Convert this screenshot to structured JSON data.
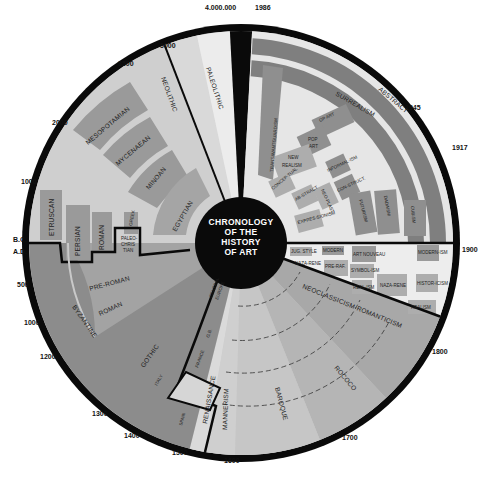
{
  "title": {
    "lines": [
      "CHRONOLOGY",
      "OF THE",
      "HISTORY",
      "OF ART"
    ]
  },
  "colors": {
    "ring": "#0a0a0a",
    "background": "#ffffff",
    "prehistoric_light": "#ececec",
    "neolithic": "#d9d9d9",
    "ancient_light": "#cfcfcf",
    "ancient_box": "#9a9a9a",
    "medieval": "#8c8c8c",
    "medieval_light": "#a9a9a9",
    "renaissance_light": "#d6d6d6",
    "baroque": "#bdbdbd",
    "modern_band": "#7f7f7f",
    "modern_bg": "#e6e6e6",
    "modern_box": "#8f8f8f",
    "modern_box_light": "#adadad"
  },
  "timeline_ticks": [
    {
      "label": "4.000.000",
      "angle": -3
    },
    {
      "label": "1986",
      "angle": 3
    },
    {
      "label": "1945",
      "angle": 46
    },
    {
      "label": "1917",
      "angle": 64
    },
    {
      "label": "1900",
      "angle": 90
    },
    {
      "label": "1800",
      "angle": 122
    },
    {
      "label": "1700",
      "angle": 152
    },
    {
      "label": "1600",
      "angle": 182
    },
    {
      "label": "1500",
      "angle": 196
    },
    {
      "label": "1400",
      "angle": 209
    },
    {
      "label": "1300",
      "angle": 222
    },
    {
      "label": "1200",
      "angle": 238
    },
    {
      "label": "1000",
      "angle": 250
    },
    {
      "label": "500",
      "angle": 261
    },
    {
      "label": "A.D.",
      "angle": 272
    },
    {
      "label": "B.C.",
      "angle": 268
    },
    {
      "label": "1000",
      "angle": 288
    },
    {
      "label": "2000",
      "angle": 305
    },
    {
      "label": "3500",
      "angle": 328
    },
    {
      "label": "5000",
      "angle": 339
    }
  ],
  "eras": {
    "prehistoric": [
      "PALEOLITHIC",
      "NEOLITHIC"
    ],
    "ancient": [
      "MESOPOTAMIAN",
      "MYCENAEAN",
      "MINOAN",
      "EGYPTIAN",
      "GREEK",
      "ETRUSCAN",
      "PERSIAN",
      "ROMAN",
      "PALEO-CHRISTIAN"
    ],
    "medieval": [
      "BYZANTINE",
      "PRE-ROMAN",
      "ROMAN",
      "GOTHIC",
      "CENTRAL EUROPE",
      "G.B.",
      "FRANCE",
      "ITALY",
      "SPAIN"
    ],
    "renaissance_baroque": [
      "RENAISSANCE",
      "MANNERISM",
      "BAROQUE",
      "ROCOCO",
      "NEOCLASSICISM-ROMANTICISM"
    ],
    "nineteenth_century": [
      "JUNG STYLE",
      "NAZARENE",
      "MODERNISM",
      "PRE-RAPHAELITE",
      "SYMBOLISM",
      "ART NOUVEAU",
      "SYMBOLISM",
      "REALISM",
      "NAZARENE",
      "MODERNISM",
      "HISTORICISM",
      "REALISM"
    ],
    "modern": [
      "ABSTRACT",
      "SURREALISM",
      "TRANSAVANTGARDISM",
      "OP ART",
      "POP ART",
      "NEW REALISM",
      "INFORMALISM",
      "CONSTRUCTIVISM",
      "FUTURISM",
      "DADAISM",
      "CUBISM",
      "CONCEPTUAL",
      "ABSTRACT",
      "NEO-PLASTICISM",
      "EXPRESSIONISM"
    ]
  },
  "labels": {
    "paleolithic": "PALEOLITHIC",
    "neolithic": "NEOLITHIC",
    "mesopotamian": "MESOPOTAMIAN",
    "mycenaean": "MYCENAEAN",
    "minoan": "MINOAN",
    "egyptian": "EGYPTIAN",
    "greek": "GREEK",
    "etruscan": "ETRUSCAN",
    "persian": "PERSIAN",
    "roman_ancient": "ROMAN",
    "paleo1": "PALEO-",
    "paleo2": "CHRIS",
    "paleo3": "TIAN",
    "byzantine": "BYZANTINE",
    "preroman": "PRE-ROMAN",
    "roman_med": "ROMAN",
    "gothic": "GOTHIC",
    "central1": "CENTRAL",
    "central2": "EUROPE",
    "gb": "G.B.",
    "france": "FRANCE",
    "italy": "ITALY",
    "spain": "SPAIN",
    "renaissance": "RENAISSANCE",
    "mannerism": "MANNERISM",
    "baroque": "BAROQUE",
    "rococo": "ROCOCO",
    "neoclassicism": "NEOCLASSICISM-ROMANTICISM",
    "abstract": "ABSTRACT",
    "surrealism": "SURREALISM",
    "transavant": "TRANSAVANTGUARDISM",
    "opart": "OP ART",
    "popart1": "POP",
    "popart2": "ART",
    "newrealism1": "NEW",
    "newrealism2": "REALISM",
    "informal": "INFORMAL-ISM",
    "constructivism": "CON-STRUCT.",
    "futurism": "FUTURISM",
    "dadaism": "DADAISM",
    "cubism": "CUBISM",
    "conceptual": "CONCEP-TUAL",
    "abstract2": "AB-STRACT",
    "neoplastic": "NEO-PLAST.",
    "expressionism": "EXPRES-SIONISM",
    "jugend": "JUG. STYLE",
    "nazarene1": "NAZA-RENE",
    "modern1": "MODERN",
    "prerafael": "PRE-RAF.",
    "symbolism1": "SYMBOL",
    "artnouveau": "ART NOUVEAU",
    "symbolism2": "SYMBOL-ISM",
    "realism1": "REAL-ISM",
    "nazarene2": "NAZA-RENE",
    "modernism2": "MODERN-ISM",
    "historicism": "HISTOR-ICISM",
    "realism2": "REALISM"
  }
}
